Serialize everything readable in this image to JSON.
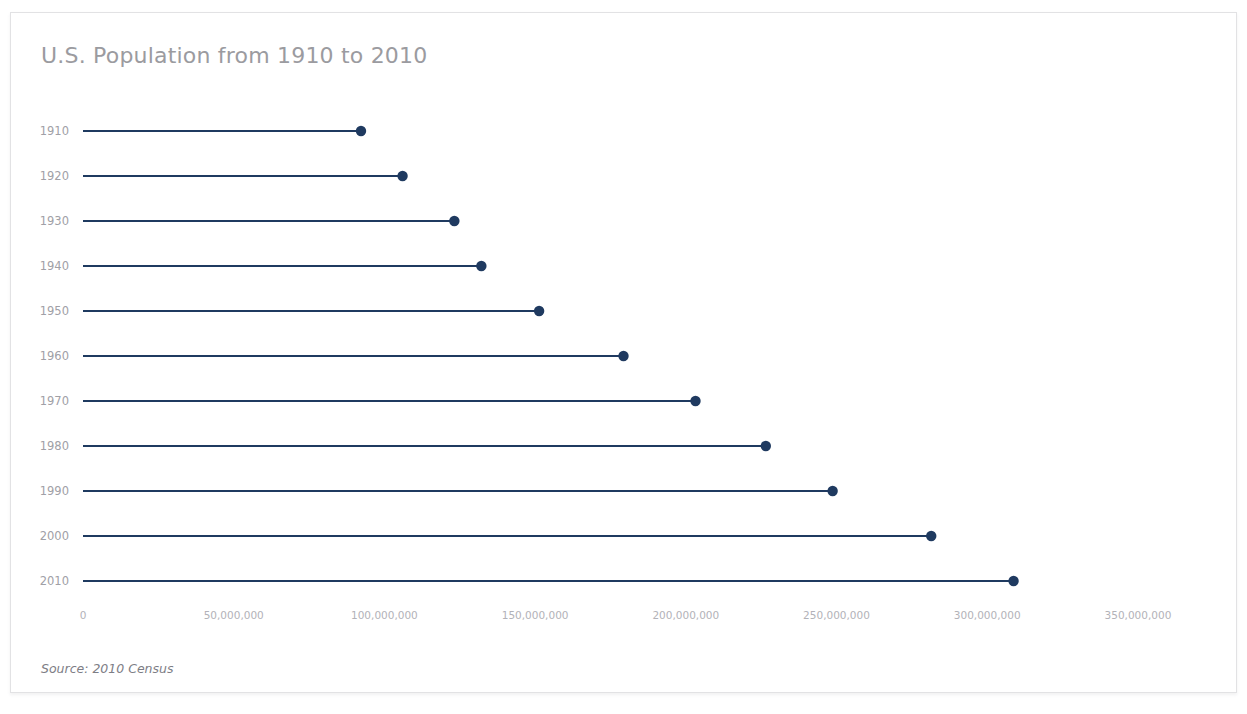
{
  "card": {
    "background": "#ffffff",
    "border_color": "#e2e2e4"
  },
  "title": "U.S. Population from 1910 to 2010",
  "title_color": "#9b9ba0",
  "source_note": "Source: 2010 Census",
  "accent_color": "#1f3a60",
  "chart_data": {
    "type": "bar",
    "subtype": "lollipop-horizontal",
    "title": "U.S. Population from 1910 to 2010",
    "subtitle": "",
    "xlabel": "",
    "ylabel": "",
    "orientation": "horizontal",
    "grid": false,
    "legend": null,
    "legend_position": "none",
    "annotations": [
      "Source: 2010 Census"
    ],
    "categories": [
      "1910",
      "1920",
      "1930",
      "1940",
      "1950",
      "1960",
      "1970",
      "1980",
      "1990",
      "2000",
      "2010"
    ],
    "values": [
      92228496,
      106021537,
      123202624,
      132164569,
      151325798,
      179323175,
      203211926,
      226545805,
      248709873,
      281421906,
      308745538
    ],
    "xlim": [
      0,
      355000000
    ],
    "ylim": null,
    "x_ticks": [
      0,
      50000000,
      100000000,
      150000000,
      200000000,
      250000000,
      300000000,
      350000000
    ],
    "x_tick_labels": [
      "0",
      "50,000,000",
      "100,000,000",
      "150,000,000",
      "200,000,000",
      "250,000,000",
      "300,000,000",
      "350,000,000"
    ],
    "y_tick_labels": [
      "1910",
      "1920",
      "1930",
      "1940",
      "1950",
      "1960",
      "1970",
      "1980",
      "1990",
      "2000",
      "2010"
    ],
    "series": [
      {
        "name": "U.S. Population",
        "color": "#1f3a60",
        "values": [
          92228496,
          106021537,
          123202624,
          132164569,
          151325798,
          179323175,
          203211926,
          226545805,
          248709873,
          281421906,
          308745538
        ]
      }
    ]
  }
}
